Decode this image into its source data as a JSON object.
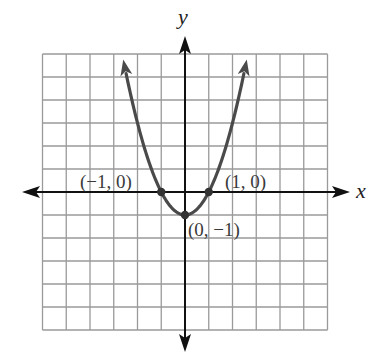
{
  "chart_data": {
    "type": "line",
    "title": "",
    "function": "y = x^2 - 1",
    "xlabel": "x",
    "ylabel": "y",
    "xlim": [
      -6,
      6
    ],
    "ylim": [
      -6,
      6
    ],
    "grid": true,
    "grid_step": 1,
    "series": [
      {
        "name": "parabola",
        "x": [
          -2.6,
          -2,
          -1.5,
          -1,
          -0.5,
          0,
          0.5,
          1,
          1.5,
          2,
          2.6
        ],
        "y": [
          5.76,
          3,
          1.25,
          0,
          -0.75,
          -1,
          -0.75,
          0,
          1.25,
          3,
          5.76
        ],
        "arrows_at_ends": true
      }
    ],
    "points": [
      {
        "x": -1,
        "y": 0,
        "label": "(−1, 0)"
      },
      {
        "x": 1,
        "y": 0,
        "label": "(1, 0)"
      },
      {
        "x": 0,
        "y": -1,
        "label": "(0, −1)"
      }
    ],
    "annotations": [
      "(−1, 0)",
      "(1, 0)",
      "(0, −1)"
    ]
  },
  "layout": {
    "origin_px": [
      185,
      192
    ],
    "unit_px_x": 23.75,
    "unit_px_y": 23.0,
    "axis_x_extent_px": [
      22,
      350
    ],
    "axis_y_extent_px": [
      36,
      352
    ],
    "colors": {
      "grid": "#9a9a9a",
      "axes": "#111111",
      "curve": "#4a4a4a",
      "points": "#333333",
      "labels": "#3a3a3a"
    }
  }
}
